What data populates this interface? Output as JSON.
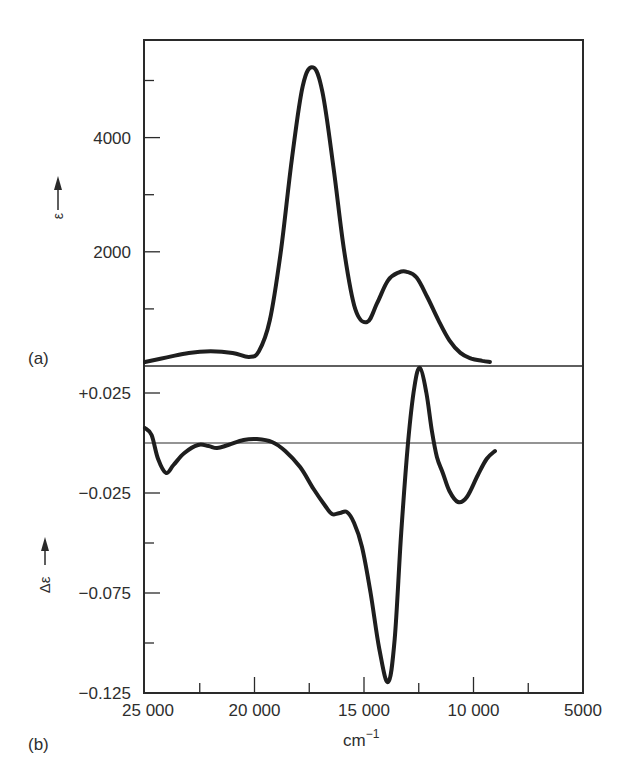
{
  "figure": {
    "panel_a_label": "(a)",
    "panel_b_label": "(b)",
    "xlabel": "cm",
    "xlabel_sup": "−1",
    "ylabel_a": "ε",
    "ylabel_b": "Δε",
    "line_color": "#1e1e1e",
    "frame_color": "#2a2a2a"
  },
  "chart_data": [
    {
      "panel": "(a)",
      "type": "line",
      "title": "",
      "xlabel": "cm⁻¹",
      "ylabel": "ε →",
      "xlim": [
        25000,
        5000
      ],
      "ylim": [
        0,
        5700
      ],
      "x_reversed": true,
      "x_ticks": [
        25000,
        20000,
        15000,
        10000,
        5000
      ],
      "x_tick_labels": [
        "25 000",
        "20 000",
        "15 000",
        "10 000",
        "5000"
      ],
      "y_ticks": [
        1000,
        2000,
        3000,
        4000,
        5000
      ],
      "y_tick_labels": [
        "",
        "2000",
        "",
        "4000",
        ""
      ],
      "grid": false,
      "legend": null,
      "series": [
        {
          "name": "absorption ε",
          "x": [
            25000,
            24000,
            23000,
            22000,
            21000,
            20250,
            19800,
            19300,
            18800,
            18300,
            17800,
            17330,
            16900,
            16400,
            15900,
            15400,
            14860,
            14400,
            13900,
            13400,
            13040,
            12600,
            12100,
            11600,
            11100,
            10600,
            10100,
            9600,
            9250
          ],
          "y": [
            70,
            150,
            230,
            260,
            230,
            160,
            260,
            800,
            2000,
            3600,
            4900,
            5230,
            4800,
            3500,
            2000,
            1000,
            770,
            1100,
            1500,
            1640,
            1650,
            1550,
            1200,
            800,
            450,
            230,
            130,
            90,
            70
          ]
        }
      ]
    },
    {
      "panel": "(b)",
      "type": "line",
      "title": "",
      "xlabel": "cm⁻¹",
      "ylabel": "Δε →",
      "xlim": [
        25000,
        5000
      ],
      "ylim": [
        -0.125,
        0.0385
      ],
      "x_reversed": true,
      "x_ticks": [
        25000,
        22500,
        20000,
        17500,
        15000,
        12500,
        10000,
        7500,
        5000
      ],
      "x_tick_labels": [
        "25 000",
        "",
        "20 000",
        "",
        "15 000",
        "",
        "10 000",
        "",
        "5000"
      ],
      "y_ticks": [
        0.025,
        0,
        -0.025,
        -0.05,
        -0.075,
        -0.1,
        -0.125
      ],
      "y_tick_labels": [
        "+0.025",
        "",
        "−0.025",
        "",
        "−0.075",
        "",
        "−0.125"
      ],
      "zero_line": true,
      "grid": false,
      "legend": null,
      "series": [
        {
          "name": "circular dichroism Δε",
          "x": [
            25000,
            24700,
            24400,
            24040,
            23700,
            23200,
            22580,
            22100,
            21710,
            21200,
            20500,
            19890,
            19200,
            18600,
            17920,
            17300,
            16800,
            16460,
            16100,
            15780,
            15450,
            15090,
            14700,
            14300,
            13900,
            13600,
            13300,
            12990,
            12700,
            12440,
            12150,
            11900,
            11670,
            11400,
            11100,
            10710,
            10300,
            9800,
            9400,
            9020
          ],
          "y": [
            0.0075,
            0.004,
            -0.008,
            -0.015,
            -0.011,
            -0.005,
            -0.001,
            -0.0015,
            -0.0025,
            -0.001,
            0.0015,
            0.002,
            0.0005,
            -0.004,
            -0.012,
            -0.023,
            -0.031,
            -0.0355,
            -0.035,
            -0.0345,
            -0.04,
            -0.052,
            -0.075,
            -0.103,
            -0.1195,
            -0.098,
            -0.045,
            0.0,
            0.028,
            0.0375,
            0.025,
            0.006,
            -0.007,
            -0.015,
            -0.024,
            -0.0295,
            -0.027,
            -0.016,
            -0.008,
            -0.004
          ]
        }
      ]
    }
  ]
}
